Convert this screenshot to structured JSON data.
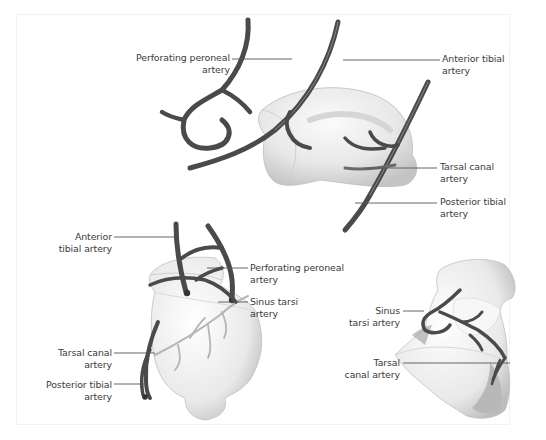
{
  "figure": {
    "panels": [
      {
        "id": "top",
        "labels": [
          {
            "lines": [
              "Perforating peroneal",
              "artery"
            ]
          },
          {
            "lines": [
              "Anterior tibial",
              "artery"
            ]
          },
          {
            "lines": [
              "Tarsal canal",
              "artery"
            ]
          },
          {
            "lines": [
              "Posterior tibial",
              "artery"
            ]
          }
        ]
      },
      {
        "id": "bottom-left",
        "labels": [
          {
            "lines": [
              "Anterior",
              "tibial artery"
            ]
          },
          {
            "lines": [
              "Perforating peroneal",
              "artery"
            ]
          },
          {
            "lines": [
              "Sinus tarsi",
              "artery"
            ]
          },
          {
            "lines": [
              "Tarsal canal",
              "artery"
            ]
          },
          {
            "lines": [
              "Posterior tibial",
              "artery"
            ]
          }
        ]
      },
      {
        "id": "bottom-right",
        "labels": [
          {
            "lines": [
              "Sinus",
              "tarsi artery"
            ]
          },
          {
            "lines": [
              "Tarsal",
              "canal artery"
            ]
          }
        ]
      }
    ],
    "colors": {
      "artery": "#4a4a4a",
      "artery_highlight": "#8a8a8a",
      "bone": "#ececec",
      "bone_shadow": "#c9c9c9",
      "leader": "#555555",
      "label_text": "#3a3a3a"
    }
  }
}
